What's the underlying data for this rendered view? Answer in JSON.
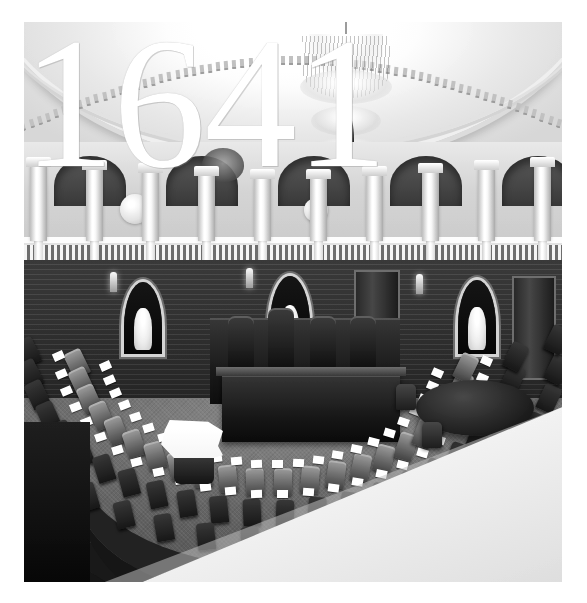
{
  "page": {
    "background_color": "#ffffff",
    "margin_color": "#ffffff"
  },
  "overlay": {
    "year": "1641",
    "color": "#ffffff",
    "style": "serif-didone-numerals"
  },
  "photo": {
    "subject": "legislative chamber interior",
    "color_mode": "black-and-white",
    "tone_dark": "#141414",
    "tone_mid": "#6f6f6f",
    "tone_light": "#fdfdfd",
    "frame": {
      "left": 24,
      "top": 22,
      "width": 538,
      "height": 560
    }
  },
  "scene": {
    "elements": [
      {
        "name": "domed-ceiling",
        "label": "Domed plaster ceiling with dentil cornice"
      },
      {
        "name": "crystal-chandelier",
        "label": "Central crystal chandelier"
      },
      {
        "name": "upper-gallery",
        "label": "Upper gallery with columns and balustrade"
      },
      {
        "name": "wall-medallion",
        "label": "Round wall medallion"
      },
      {
        "name": "wall-seal",
        "label": "Carved wall seal"
      },
      {
        "name": "arched-niche",
        "label": "Arched niche with marble bust"
      },
      {
        "name": "presiding-rostrum",
        "label": "Presiding officer's rostrum"
      },
      {
        "name": "clerk-desk",
        "label": "Clerk's desk"
      },
      {
        "name": "member-desk-arc",
        "label": "Semicircular member desk rows"
      },
      {
        "name": "member-chair",
        "label": "Member chair"
      },
      {
        "name": "desk-papers",
        "label": "White papers on desks"
      },
      {
        "name": "oval-table",
        "label": "Oval conference table"
      },
      {
        "name": "side-chair",
        "label": "Wooden side chair"
      },
      {
        "name": "speaking-podium",
        "label": "Speaking podium with documents"
      },
      {
        "name": "chamber-floor",
        "label": "Carpeted chamber floor"
      },
      {
        "name": "foreground-railing",
        "label": "Bright foreground railing"
      }
    ],
    "counts": {
      "desk_rows": 3,
      "niches": 3,
      "gallery_columns": 10
    }
  }
}
